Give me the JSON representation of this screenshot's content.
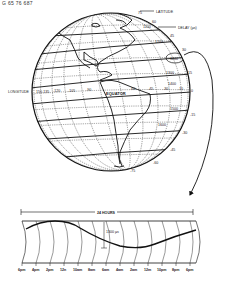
{
  "figure": {
    "caption": "G 65 76 687"
  },
  "globe": {
    "latitude_label": "LATITUDE",
    "delay_label": "DELAY (µs)",
    "longitude_label": "LONGITUDE",
    "equator_label": "EQUATOR",
    "latitude_ticks": [
      "75",
      "60",
      "45",
      "30",
      "15",
      "0",
      "-15",
      "-30",
      "-45",
      "-60",
      "-75"
    ],
    "longitude_ticks": [
      "150-135",
      "-120",
      "-105",
      "-90",
      "-75",
      "-60",
      "-45",
      "-30",
      "-15"
    ],
    "delay_contours": [
      "1100",
      "1200",
      "1300",
      "1400",
      "1500",
      "1600"
    ],
    "highlighted_delay": "1200"
  },
  "timeline": {
    "span_label": "24 HOURS",
    "amplitude_label": "1300 µs",
    "time_ticks": [
      "6pm",
      "4pm",
      "2pm",
      "12n",
      "10am",
      "8am",
      "6am",
      "4am",
      "2am",
      "12m",
      "10pm",
      "8pm",
      "6pm"
    ]
  }
}
